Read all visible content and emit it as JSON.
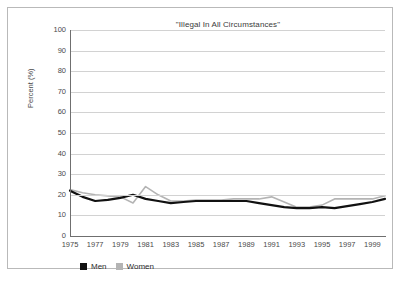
{
  "chart_data": {
    "type": "line",
    "title": "\"Illegal In All Circumstances\"",
    "xlabel": "",
    "ylabel": "Percent (%)",
    "ylim": [
      0,
      100
    ],
    "ytick_step": 10,
    "yticks": [
      "100",
      "90",
      "80",
      "70",
      "60",
      "50",
      "40",
      "30",
      "20",
      "10",
      "0"
    ],
    "x": [
      1975,
      1976,
      1977,
      1978,
      1979,
      1980,
      1981,
      1982,
      1983,
      1984,
      1985,
      1986,
      1987,
      1988,
      1989,
      1990,
      1991,
      1992,
      1993,
      1994,
      1995,
      1996,
      1997,
      1998,
      1999,
      2000
    ],
    "xticks": [
      "1975",
      "1977",
      "1979",
      "1981",
      "1983",
      "1985",
      "1987",
      "1989",
      "1991",
      "1993",
      "1995",
      "1997",
      "1999"
    ],
    "xlim": [
      1975,
      2000
    ],
    "grid": "horizontal",
    "legend_position": "bottom-left",
    "series": [
      {
        "name": "Men",
        "color": "#111111",
        "values": [
          22,
          19,
          17,
          17.5,
          18.5,
          20,
          18,
          17,
          16,
          16.5,
          17,
          17,
          17,
          17,
          17,
          16,
          15,
          14,
          13.5,
          13.5,
          14,
          13.5,
          14.5,
          15.5,
          16.5,
          18
        ]
      },
      {
        "name": "Women",
        "color": "#b4b4b4",
        "values": [
          22.5,
          21,
          20,
          19.5,
          19,
          16,
          24,
          20,
          17,
          17,
          17.5,
          17.5,
          17.5,
          18,
          18,
          18,
          19,
          16.5,
          14,
          14,
          15,
          18,
          18,
          18,
          18,
          19.5
        ]
      }
    ]
  },
  "legend": {
    "entries": [
      {
        "label": "Men",
        "color": "#111111"
      },
      {
        "label": "Women",
        "color": "#b4b4b4"
      }
    ]
  }
}
